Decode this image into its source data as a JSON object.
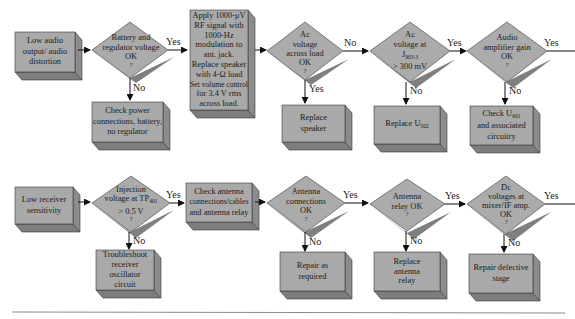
{
  "colors": {
    "box_face": "#a9a9a9",
    "box_side": "#8c8c8c",
    "box_bottom": "#7d7d7d",
    "diamond_face": "#ababab",
    "diamond_shadow": "#7f7f7f",
    "outline": "#3a3a3a",
    "arrow": "#111111",
    "rule": "#8a8a8a",
    "background": "#ffffff"
  },
  "flowchart_top": {
    "start": {
      "lines": [
        "Low audio",
        "output/ audio",
        "distortion"
      ]
    },
    "decision1": {
      "lines": [
        "Battery and",
        "regulator voltage",
        "OK",
        "?"
      ],
      "yes_label": "Yes",
      "no_label": "No"
    },
    "action1_no": {
      "lines": [
        "Check power",
        "connections, battery,",
        "no regulator"
      ]
    },
    "setup": {
      "lines": [
        "Apply 1000-μV",
        "RF signal with",
        "1000-Hz",
        "modulation to",
        "ant. jack.",
        "Replace speaker",
        "with 4-Ω load",
        "Set volume control",
        "for 3.4 V rms",
        "across load."
      ]
    },
    "decision2": {
      "lines": [
        "Ac",
        "voltage",
        "across load",
        "OK",
        "?"
      ],
      "no_label": "No",
      "yes_label": "Yes"
    },
    "action2_yes": {
      "lines": [
        "Replace",
        "speaker"
      ]
    },
    "decision3": {
      "line1": "Ac",
      "line2": "voltage at",
      "line3_main": "J",
      "line3_sub": "903-3",
      "line4": "> 300 mV",
      "yes_label": "Yes",
      "no_label": "No"
    },
    "action3_no": {
      "main": "Replace U",
      "sub": "502"
    },
    "decision4": {
      "lines": [
        "Audio",
        "amplifier gain",
        "OK",
        "?"
      ],
      "yes_label": "Yes",
      "no_label": "No"
    },
    "action4_no": {
      "line1_main": "Check U",
      "line1_sub": "601",
      "line2": "and associated",
      "line3": "circuitry"
    }
  },
  "flowchart_bottom": {
    "start": {
      "lines": [
        "Low receiver",
        "sensitivity"
      ]
    },
    "decision1": {
      "line1": "Injection",
      "line2_main": "voltage at TP",
      "line2_sub": "401",
      "line3": "> 0.5 V",
      "line4": "?",
      "yes_label": "Yes",
      "no_label": "No"
    },
    "action1_no": {
      "lines": [
        "Troubleshoot",
        "receiver",
        "oscillator",
        "circuit"
      ]
    },
    "check": {
      "lines": [
        "Check antenna",
        "connections/cables",
        "and antenna relay"
      ]
    },
    "decision2": {
      "lines": [
        "Antenna",
        "connections",
        "OK",
        "?"
      ],
      "yes_label": "Yes",
      "no_label": "No"
    },
    "action2_no": {
      "lines": [
        "Repair as",
        "required"
      ]
    },
    "decision3": {
      "lines": [
        "Antenna",
        "relay OK",
        "?"
      ],
      "yes_label": "Yes",
      "no_label": "No"
    },
    "action3_no": {
      "lines": [
        "Replace",
        "antenna",
        "relay"
      ]
    },
    "decision4": {
      "lines": [
        "Dc",
        "voltages at",
        "mixer/IF amp.",
        "OK",
        "?"
      ],
      "yes_label": "Yes",
      "no_label": "No"
    },
    "action4_no": {
      "lines": [
        "Repair defective",
        "stage"
      ]
    }
  }
}
